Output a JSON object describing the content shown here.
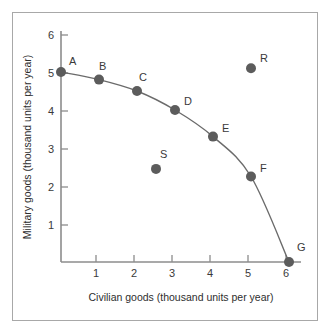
{
  "chart_data": {
    "type": "scatter",
    "title": "",
    "xlabel": "Civilian goods (thousand units per year)",
    "ylabel": "Military goods (thousand units per year)",
    "xlim": [
      0,
      6.4
    ],
    "ylim": [
      0,
      6.4
    ],
    "xticks": [
      "1",
      "2",
      "3",
      "4",
      "5",
      "6"
    ],
    "xtick_values": [
      1,
      2,
      3,
      4,
      5,
      6
    ],
    "yticks": [
      "1",
      "2",
      "3",
      "4",
      "5",
      "6"
    ],
    "ytick_values": [
      1,
      2,
      3,
      4,
      5,
      6
    ],
    "grid": false,
    "legend": "none",
    "series": [
      {
        "name": "Production possibilities frontier",
        "on_curve": true,
        "points": [
          {
            "label": "A",
            "x": 0,
            "y": 5.0,
            "label_dx": 8,
            "label_dy": -7
          },
          {
            "label": "B",
            "x": 1,
            "y": 4.8,
            "label_dx": 0,
            "label_dy": -10
          },
          {
            "label": "C",
            "x": 2,
            "y": 4.5,
            "label_dx": 2,
            "label_dy": -10
          },
          {
            "label": "D",
            "x": 3,
            "y": 4.0,
            "label_dx": 9,
            "label_dy": -5
          },
          {
            "label": "E",
            "x": 4,
            "y": 3.3,
            "label_dx": 9,
            "label_dy": -5
          },
          {
            "label": "F",
            "x": 5,
            "y": 2.25,
            "label_dx": 9,
            "label_dy": -5
          },
          {
            "label": "G",
            "x": 6,
            "y": 0.0,
            "label_dx": 8,
            "label_dy": -11
          }
        ]
      },
      {
        "name": "Off-curve points",
        "on_curve": false,
        "points": [
          {
            "label": "R",
            "x": 5.0,
            "y": 5.1,
            "label_dx": 9,
            "label_dy": -6
          },
          {
            "label": "S",
            "x": 2.5,
            "y": 2.45,
            "label_dx": 4,
            "label_dy": -11
          }
        ]
      }
    ],
    "colors": {
      "dot": "#5c5c5c",
      "curve": "#6b6b6b",
      "axis": "#8c8c8c",
      "text": "#3a3a3a",
      "frame": "#a8a8a8",
      "background": "#ffffff"
    }
  }
}
